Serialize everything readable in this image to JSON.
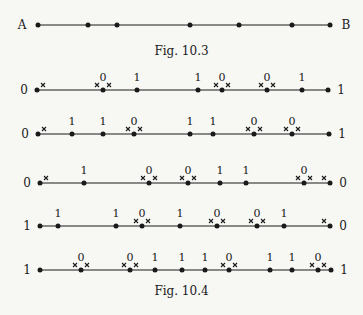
{
  "fig103": {
    "caption": "Fig. 10.3",
    "left_label": "A",
    "right_label": "B",
    "y": 25,
    "x_start": 38,
    "x_end": 330,
    "points": [
      38,
      88,
      117,
      190,
      239,
      292,
      330
    ]
  },
  "fig104": {
    "caption": "Fig. 10.4",
    "lines": [
      {
        "y": 90,
        "left_label": "0",
        "right_label": "1",
        "points": [
          {
            "x": 37,
            "label": "",
            "marks": "right"
          },
          {
            "x": 103,
            "label": "0",
            "marks": "both"
          },
          {
            "x": 137,
            "label": "1",
            "marks": ""
          },
          {
            "x": 198,
            "label": "1",
            "marks": ""
          },
          {
            "x": 222,
            "label": "0",
            "marks": "both"
          },
          {
            "x": 267,
            "label": "0",
            "marks": "both"
          },
          {
            "x": 302,
            "label": "1",
            "marks": ""
          },
          {
            "x": 328,
            "label": "",
            "marks": ""
          }
        ]
      },
      {
        "y": 134,
        "left_label": "0",
        "right_label": "1",
        "points": [
          {
            "x": 38,
            "label": "",
            "marks": "right"
          },
          {
            "x": 72,
            "label": "1",
            "marks": ""
          },
          {
            "x": 103,
            "label": "1",
            "marks": ""
          },
          {
            "x": 134,
            "label": "0",
            "marks": "both"
          },
          {
            "x": 190,
            "label": "1",
            "marks": ""
          },
          {
            "x": 213,
            "label": "1",
            "marks": ""
          },
          {
            "x": 254,
            "label": "0",
            "marks": "both"
          },
          {
            "x": 292,
            "label": "0",
            "marks": "both"
          },
          {
            "x": 329,
            "label": "",
            "marks": ""
          }
        ]
      },
      {
        "y": 183,
        "left_label": "0",
        "right_label": "0",
        "points": [
          {
            "x": 40,
            "label": "",
            "marks": "right"
          },
          {
            "x": 84,
            "label": "1",
            "marks": ""
          },
          {
            "x": 149,
            "label": "0",
            "marks": "both"
          },
          {
            "x": 188,
            "label": "0",
            "marks": "both"
          },
          {
            "x": 220,
            "label": "1",
            "marks": ""
          },
          {
            "x": 246,
            "label": "1",
            "marks": ""
          },
          {
            "x": 304,
            "label": "0",
            "marks": "both"
          },
          {
            "x": 330,
            "label": "",
            "marks": "left"
          }
        ]
      },
      {
        "y": 226,
        "left_label": "1",
        "right_label": "0",
        "points": [
          {
            "x": 40,
            "label": "",
            "marks": ""
          },
          {
            "x": 58,
            "label": "1",
            "marks": ""
          },
          {
            "x": 116,
            "label": "1",
            "marks": ""
          },
          {
            "x": 142,
            "label": "0",
            "marks": "both"
          },
          {
            "x": 180,
            "label": "1",
            "marks": ""
          },
          {
            "x": 217,
            "label": "0",
            "marks": "both"
          },
          {
            "x": 257,
            "label": "0",
            "marks": "both"
          },
          {
            "x": 284,
            "label": "1",
            "marks": ""
          },
          {
            "x": 330,
            "label": "",
            "marks": "left"
          }
        ]
      },
      {
        "y": 270,
        "left_label": "1",
        "right_label": "1",
        "points": [
          {
            "x": 40,
            "label": "",
            "marks": ""
          },
          {
            "x": 81,
            "label": "0",
            "marks": "both"
          },
          {
            "x": 130,
            "label": "0",
            "marks": "both"
          },
          {
            "x": 155,
            "label": "1",
            "marks": ""
          },
          {
            "x": 182,
            "label": "1",
            "marks": ""
          },
          {
            "x": 205,
            "label": "1",
            "marks": ""
          },
          {
            "x": 229,
            "label": "0",
            "marks": "both"
          },
          {
            "x": 270,
            "label": "1",
            "marks": ""
          },
          {
            "x": 292,
            "label": "1",
            "marks": ""
          },
          {
            "x": 318,
            "label": "0",
            "marks": "both"
          },
          {
            "x": 331,
            "label": "",
            "marks": ""
          }
        ]
      }
    ]
  }
}
